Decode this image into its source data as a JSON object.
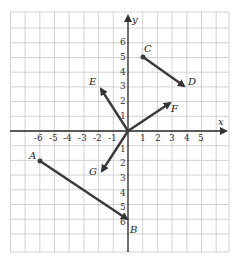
{
  "diagram": {
    "axes": {
      "x_label": "x",
      "y_label": "y"
    },
    "x_ticks": [
      "-6",
      "-5",
      "-4",
      "-3",
      "-2",
      "-1",
      "1",
      "2",
      "3",
      "4",
      "5"
    ],
    "y_ticks": [
      "6",
      "5",
      "4",
      "3",
      "2",
      "1",
      "1",
      "2",
      "3",
      "4",
      "5",
      "6"
    ],
    "points": {
      "A": "A",
      "B": "B",
      "C": "C",
      "D": "D",
      "E": "E",
      "F": "F",
      "G": "G"
    },
    "vectors": [
      {
        "name": "AB",
        "from": [
          -6,
          -2
        ],
        "to": [
          0,
          -6
        ]
      },
      {
        "name": "CD",
        "from": [
          1,
          5
        ],
        "to": [
          4,
          3
        ]
      },
      {
        "name": "OE",
        "from": [
          0,
          0
        ],
        "to": [
          -2,
          3
        ]
      },
      {
        "name": "OF",
        "from": [
          0,
          0
        ],
        "to": [
          3,
          2
        ]
      },
      {
        "name": "OG",
        "from": [
          0,
          0
        ],
        "to": [
          -2,
          -3
        ]
      }
    ],
    "colors": {
      "grid": "#c8c8c8",
      "axis": "#222222",
      "vector": "#3a3a3a"
    }
  }
}
